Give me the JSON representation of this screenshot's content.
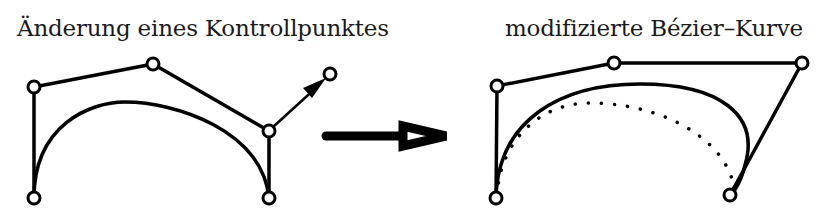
{
  "figure": {
    "left_panel": {
      "caption": "Änderung eines Kontrollpunktes",
      "control_points": [
        [
          34,
          198
        ],
        [
          34,
          87
        ],
        [
          153,
          64
        ],
        [
          269,
          131
        ],
        [
          269,
          198
        ]
      ],
      "moved_point_target": [
        330,
        74
      ]
    },
    "transition_arrow": {
      "direction": "right",
      "style": "hollow-head"
    },
    "right_panel": {
      "caption": "modifizierte Bézier–Kurve",
      "control_points": [
        [
          496,
          198
        ],
        [
          497,
          86
        ],
        [
          614,
          63
        ],
        [
          802,
          63
        ],
        [
          730,
          195
        ]
      ],
      "original_curve_style": "dotted",
      "modified_curve_style": "solid"
    },
    "colors": {
      "stroke": "#000000",
      "background": "#ffffff",
      "text": "#1a1a1a"
    }
  }
}
